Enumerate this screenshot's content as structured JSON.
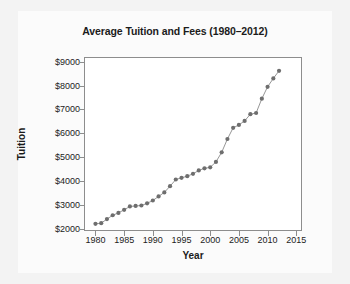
{
  "chart_data": {
    "type": "line",
    "title": "Average Tuition and Fees (1980–2012)",
    "xlabel": "Year",
    "ylabel": "Tuition",
    "xlim": [
      1978,
      2016
    ],
    "ylim": [
      1900,
      9200
    ],
    "xticks": [
      1980,
      1985,
      1990,
      1995,
      2000,
      2005,
      2010,
      2015
    ],
    "xtick_labels": [
      "1980",
      "1985",
      "1990",
      "1995",
      "2000",
      "2005",
      "2010",
      "2015"
    ],
    "yticks": [
      2000,
      3000,
      4000,
      5000,
      6000,
      7000,
      8000,
      9000
    ],
    "ytick_labels": [
      "$2000",
      "$3000",
      "$4000",
      "$5000",
      "$6000",
      "$7000",
      "$8000",
      "$9000"
    ],
    "grid": false,
    "legend": "none",
    "marker": "circle",
    "marker_color": "#6e6e6e",
    "line_color": "#8a8a8a",
    "x": [
      1980,
      1981,
      1982,
      1983,
      1984,
      1985,
      1986,
      1987,
      1988,
      1989,
      1990,
      1991,
      1992,
      1993,
      1994,
      1995,
      1996,
      1997,
      1998,
      1999,
      2000,
      2001,
      2002,
      2003,
      2004,
      2005,
      2006,
      2007,
      2008,
      2009,
      2010,
      2011,
      2012
    ],
    "values": [
      2200,
      2230,
      2400,
      2560,
      2660,
      2790,
      2930,
      2950,
      2970,
      3060,
      3180,
      3350,
      3520,
      3780,
      4060,
      4130,
      4200,
      4300,
      4440,
      4530,
      4570,
      4800,
      5200,
      5760,
      6230,
      6350,
      6520,
      6800,
      6850,
      7450,
      7950,
      8300,
      8620
    ],
    "series": [
      {
        "name": "Average Tuition and Fees",
        "values": [
          2200,
          2230,
          2400,
          2560,
          2660,
          2790,
          2930,
          2950,
          2970,
          3060,
          3180,
          3350,
          3520,
          3780,
          4060,
          4130,
          4200,
          4300,
          4440,
          4530,
          4570,
          4800,
          5200,
          5760,
          6230,
          6350,
          6520,
          6800,
          6850,
          7450,
          7950,
          8300,
          8620
        ]
      }
    ]
  },
  "colors": {
    "page_background": "#f3f3f3",
    "card_background": "#fbfbfb",
    "plot_background": "#ffffff",
    "frame": "#8d8d8d",
    "text": "#1b1b1b",
    "marker": "#6e6e6e",
    "line": "#8a8a8a"
  }
}
